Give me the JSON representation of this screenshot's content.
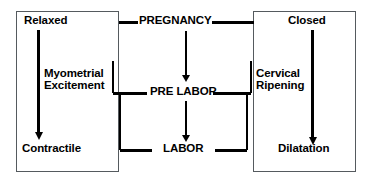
{
  "diagram": {
    "background_color": "#ffffff",
    "line_color": "#000000",
    "box_border_color": "#555a5e",
    "left_box": {
      "name": "myometrium-box",
      "top_label": "Relaxed",
      "process_label_line1": "Myometrial",
      "process_label_line2": "Excitement",
      "bottom_label": "Contractile"
    },
    "center_column": {
      "name": "stage-column",
      "stage_1": "PREGNANCY",
      "stage_2": "PRE LABOR",
      "stage_3": "LABOR"
    },
    "right_box": {
      "name": "cervix-box",
      "top_label": "Closed",
      "process_label_line1": "Cervical",
      "process_label_line2": "Ripening",
      "bottom_label": "Dilatation"
    },
    "arrows": {
      "left_column_arrow": "down-arrow-icon",
      "right_column_arrow": "down-arrow-icon",
      "center_top_arrow": "down-arrow-icon",
      "center_bottom_arrow": "down-arrow-icon"
    }
  }
}
